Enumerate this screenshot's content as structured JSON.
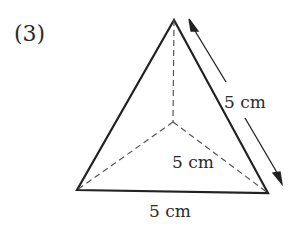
{
  "problem_number": "(3)",
  "labels": {
    "slant_edge": "5 cm",
    "inner_edge": "5 cm",
    "base_edge": "5 cm"
  },
  "colors": {
    "line": "#222222",
    "dashed": "#555555",
    "background": "#ffffff"
  }
}
